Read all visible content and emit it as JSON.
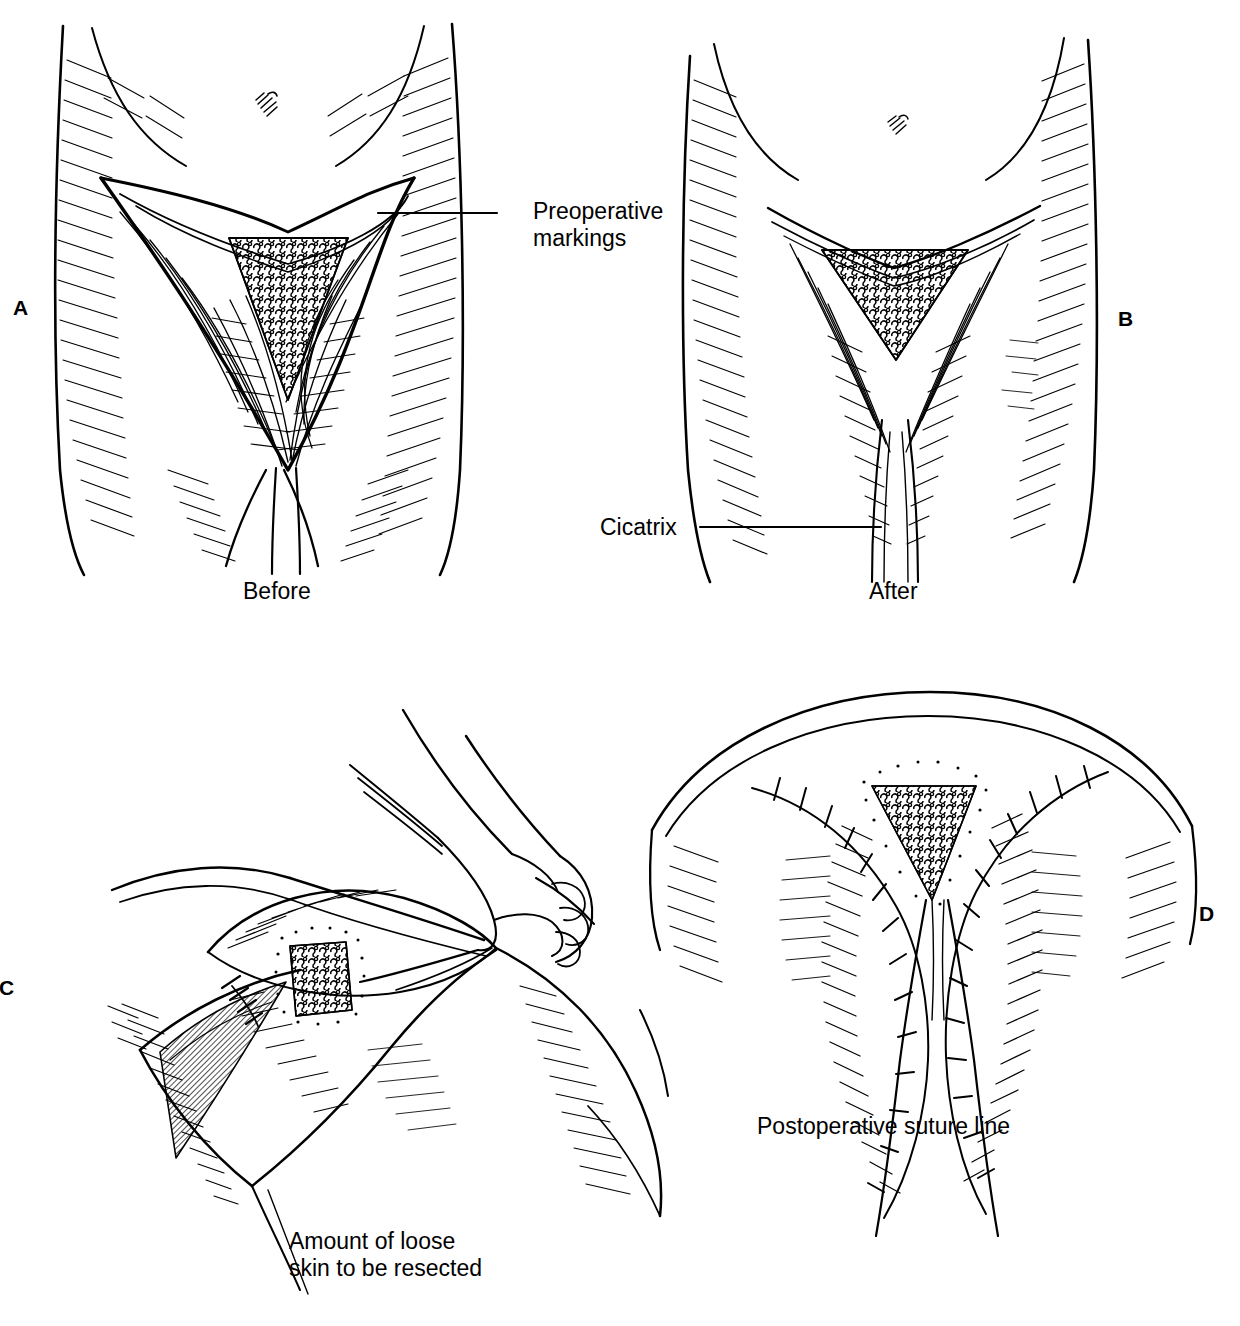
{
  "figure": {
    "background_color": "#ffffff",
    "ink_color": "#000000",
    "style": "pen-and-ink line drawing with hatching and stipple shading",
    "panel_count": 4
  },
  "panels": [
    {
      "letter": "A",
      "name": "preoperative-markings-panel",
      "subject": "Anterior view of upper thighs and groin with V-shaped preoperative incision markings",
      "caption": "Before",
      "label": "Preoperative markings"
    },
    {
      "letter": "B",
      "name": "postoperative-result-panel",
      "subject": "Anterior view of upper thighs after medial thigh lift showing healed scar",
      "caption": "After",
      "label": "Cicatrix"
    },
    {
      "letter": "C",
      "name": "skin-resection-panel",
      "subject": "Oblique intraoperative view, surgeon's hand pinching and elevating redundant medial thigh skin flap",
      "caption": "Amount of loose\nskin to be resected",
      "label": ""
    },
    {
      "letter": "D",
      "name": "suture-line-panel",
      "subject": "Inferior view of groin and perineum after closure showing interrupted suture line",
      "caption": "Postoperative suture line",
      "label": ""
    }
  ],
  "labels": {
    "preoperative_markings": "Preoperative\nmarkings",
    "cicatrix": "Cicatrix",
    "before": "Before",
    "after": "After",
    "loose_skin": "Amount of loose\nskin to be resected",
    "postoperative_suture_line": "Postoperative suture line"
  },
  "panel_letters": {
    "a": "A",
    "b": "B",
    "c": "C",
    "d": "D"
  },
  "leader_lines": [
    {
      "name": "preoperative-markings-leader",
      "from_x": 378,
      "from_y": 213,
      "to_x": 497,
      "to_y": 213
    },
    {
      "name": "cicatrix-leader",
      "from_x": 700,
      "from_y": 527,
      "to_x": 881,
      "to_y": 527
    }
  ],
  "anatomy_features": [
    "umbilicus",
    "inguinal crease",
    "pubic escutcheon",
    "medial thigh skin flap",
    "subcutaneous fat layer",
    "interrupted sutures"
  ]
}
